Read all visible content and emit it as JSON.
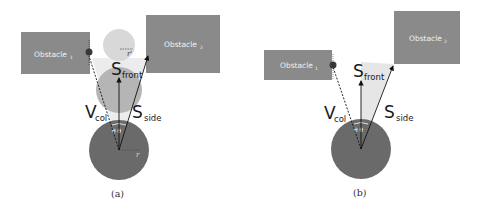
{
  "colors": {
    "obstacle": "#8a8a8a",
    "robot": "#6a6a6a",
    "ghost_near": "#b5b5b5",
    "ghost_far": "#d8d8d8",
    "cone": "#e6e6e6",
    "collision_point": "#3a3a3a",
    "arrow": "#111111"
  },
  "panels": [
    {
      "caption": "(a)",
      "obstacle_1": {
        "label": "Obstacle",
        "subscript": "1"
      },
      "obstacle_2": {
        "label": "Obstacle",
        "subscript": "2"
      },
      "s_front": {
        "main": "S",
        "sub": "front"
      },
      "s_side": {
        "main": "S",
        "sub": "side"
      },
      "v_col": {
        "main": "V",
        "sub": "col"
      },
      "theta_label": "θ θ",
      "robot_radius_label": "r",
      "ghost_radius_label": "r'"
    },
    {
      "caption": "(b)",
      "obstacle_1": {
        "label": "Obstacle",
        "subscript": "1"
      },
      "obstacle_2": {
        "label": "Obstacle",
        "subscript": "2"
      },
      "s_front": {
        "main": "S",
        "sub": "front"
      },
      "s_side": {
        "main": "S",
        "sub": "side"
      },
      "v_col": {
        "main": "V",
        "sub": "col"
      },
      "theta_label": "θ θ"
    }
  ]
}
